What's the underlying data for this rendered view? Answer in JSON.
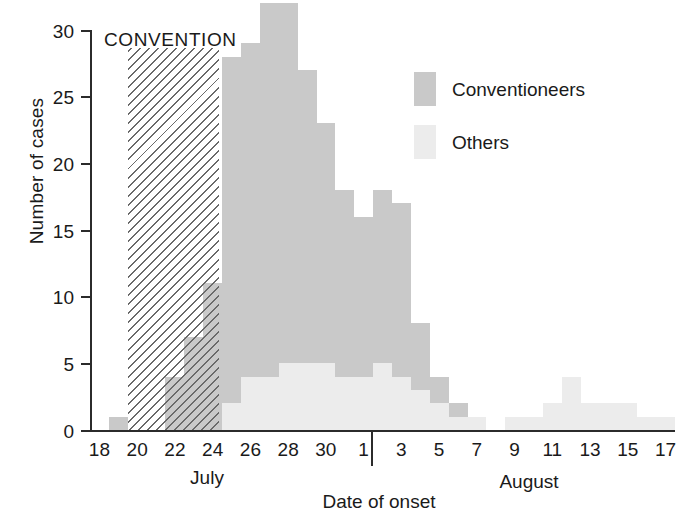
{
  "figure": {
    "annotation": "CONVENTION",
    "axis_title_x": "Date of onset",
    "axis_title_y": "Number of cases"
  },
  "legend": {
    "position": "top-right",
    "items": [
      {
        "label": "Conventioneers",
        "color": "#c9c9c9"
      },
      {
        "label": "Others",
        "color": "#ececec"
      }
    ]
  },
  "axes": {
    "y_ticks": [
      "0",
      "5",
      "10",
      "15",
      "20",
      "25",
      "30"
    ],
    "x_ticks_july": [
      "18",
      "20",
      "22",
      "24",
      "26",
      "28",
      "30"
    ],
    "x_ticks_august": [
      "1",
      "3",
      "5",
      "7",
      "9",
      "11",
      "13",
      "15",
      "17"
    ],
    "month_left": "July",
    "month_right": "August"
  },
  "chart_data": {
    "type": "bar",
    "title": "",
    "subtitle": "",
    "xlabel": "Date of onset",
    "ylabel": "Number of cases",
    "ylim": [
      0,
      30
    ],
    "ytick_step": 5,
    "grid": false,
    "stacked": true,
    "legend_position": "top-right",
    "annotations": [
      {
        "text": "CONVENTION",
        "x_start": "July 21",
        "x_end": "July 24",
        "style": "hatched-band"
      }
    ],
    "categories": [
      "Jul 18",
      "Jul 19",
      "Jul 20",
      "Jul 21",
      "Jul 22",
      "Jul 23",
      "Jul 24",
      "Jul 25",
      "Jul 26",
      "Jul 27",
      "Jul 28",
      "Jul 29",
      "Jul 30",
      "Jul 31",
      "Aug 1",
      "Aug 2",
      "Aug 3",
      "Aug 4",
      "Aug 5",
      "Aug 6",
      "Aug 7",
      "Aug 8",
      "Aug 9",
      "Aug 10",
      "Aug 11",
      "Aug 12",
      "Aug 13",
      "Aug 14",
      "Aug 15",
      "Aug 16",
      "Aug 17"
    ],
    "series": [
      {
        "name": "Conventioneers",
        "color": "#c9c9c9",
        "values": [
          0,
          1,
          0,
          0,
          4,
          7,
          11,
          26,
          25,
          28,
          27,
          22,
          18,
          14,
          12,
          13,
          13,
          5,
          2,
          1,
          0,
          0,
          0,
          0,
          0,
          0,
          0,
          0,
          0,
          0,
          0
        ]
      },
      {
        "name": "Others",
        "color": "#ececec",
        "values": [
          0,
          0,
          0,
          0,
          0,
          0,
          0,
          2,
          4,
          4,
          5,
          5,
          5,
          4,
          4,
          5,
          4,
          3,
          2,
          1,
          1,
          0,
          1,
          1,
          2,
          4,
          2,
          2,
          2,
          1,
          1
        ]
      }
    ],
    "totals": [
      0,
      1,
      0,
      0,
      4,
      7,
      11,
      26,
      25,
      28,
      27,
      22,
      18,
      14,
      12,
      13,
      13,
      5,
      2,
      1,
      1,
      0,
      1,
      1,
      2,
      4,
      2,
      2,
      2,
      1,
      1
    ]
  }
}
